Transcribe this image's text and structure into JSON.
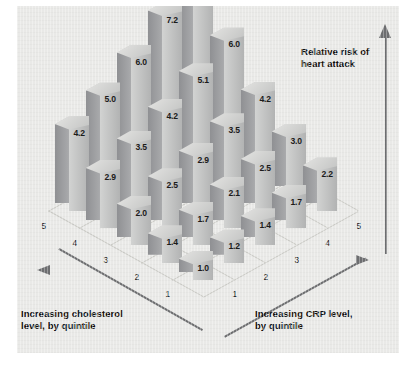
{
  "chart_data": {
    "type": "bar",
    "title": "",
    "subtitle": "",
    "zlabel": "Relative risk of\nheart attack",
    "xlabel": "Increasing CRP level,\nby quintile",
    "ylabel": "Increasing cholesterol\nlevel, by quintile",
    "xlabel_short": "Increasing CRP level, by quintile",
    "ylabel_short": "Increasing cholesterol level, by quintile",
    "zlabel_short": "Relative risk of heart attack",
    "x_categories": [
      "1",
      "2",
      "3",
      "4",
      "5"
    ],
    "y_categories": [
      "1",
      "2",
      "3",
      "4",
      "5"
    ],
    "x_axis_name": "CRP quintile",
    "y_axis_name": "Cholesterol quintile",
    "grid": false,
    "legend": "none",
    "zlim": [
      0,
      8.7
    ],
    "rows": [
      {
        "cholesterol_quintile": "1",
        "values": [
          1.0,
          1.2,
          1.4,
          1.7,
          2.2
        ]
      },
      {
        "cholesterol_quintile": "2",
        "values": [
          1.4,
          1.7,
          2.1,
          2.5,
          3.0
        ]
      },
      {
        "cholesterol_quintile": "3",
        "values": [
          2.0,
          2.5,
          2.9,
          3.5,
          4.2
        ]
      },
      {
        "cholesterol_quintile": "4",
        "values": [
          2.9,
          3.5,
          4.2,
          5.1,
          6.0
        ]
      },
      {
        "cholesterol_quintile": "5",
        "values": [
          4.2,
          5.0,
          6.0,
          7.2,
          8.7
        ]
      }
    ],
    "value_labels": [
      "1.0",
      "1.2",
      "1.4",
      "1.7",
      "2.2",
      "1.4",
      "1.7",
      "2.1",
      "2.5",
      "3.0",
      "2.0",
      "2.5",
      "2.9",
      "3.5",
      "4.2",
      "2.9",
      "3.5",
      "4.2",
      "5.1",
      "6.0",
      "4.2",
      "5.0",
      "6.0",
      "7.2",
      "8.7"
    ],
    "min_value": 1.0,
    "max_value": 8.7,
    "colors": {
      "background": "#e9e9e7",
      "bar_top": "#dcdcda",
      "bar_left": "#9a9b9e",
      "bar_right": "#c6c7c6",
      "axis": "#6d6e70",
      "floor_line": "#c9c9c4",
      "text": "#111111"
    }
  },
  "axes": {
    "left_ticks": [
      "5",
      "4",
      "3",
      "2",
      "1"
    ],
    "right_ticks": [
      "1",
      "2",
      "3",
      "4",
      "5"
    ]
  }
}
